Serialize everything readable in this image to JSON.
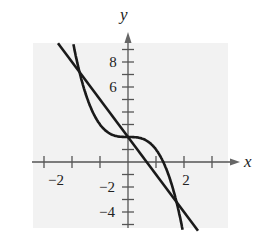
{
  "chart_data": {
    "type": "line",
    "title": "",
    "xlabel": "x",
    "ylabel": "y",
    "xlim": [
      -3.4,
      3.6
    ],
    "ylim": [
      -5.4,
      9.6
    ],
    "x_ticks": [
      -3,
      -2,
      -1,
      1,
      2,
      3
    ],
    "x_tick_labels": [
      "-2",
      "2"
    ],
    "y_ticks": [
      -5,
      -4,
      -3,
      -2,
      -1,
      1,
      2,
      3,
      4,
      5,
      6,
      7,
      8,
      9
    ],
    "y_tick_labels": [
      "8",
      "6",
      "-2",
      "-4"
    ],
    "grid": false,
    "background": "#f2f2f2",
    "series": [
      {
        "name": "cubic",
        "expression": "y = -x^3 + 2",
        "x": [
          -1.95,
          -1.5,
          -1,
          -0.5,
          0,
          0.5,
          1,
          1.5,
          1.95
        ],
        "y": [
          9.4,
          5.4,
          3,
          2.1,
          2,
          1.9,
          1,
          -1.4,
          -5.4
        ]
      },
      {
        "name": "line",
        "expression": "y = -3x + 2",
        "x": [
          -2.5,
          2.5
        ],
        "y": [
          9.5,
          -5.5
        ]
      }
    ],
    "intersections": [
      [
        -1.73,
        7.2
      ],
      [
        0,
        2
      ],
      [
        1.73,
        -3.2
      ]
    ]
  },
  "labels": {
    "x_axis": "x",
    "y_axis": "y",
    "xm2": "−2",
    "x2": "2",
    "y8": "8",
    "y6": "6",
    "ym2": "−2",
    "ym4": "−4"
  }
}
